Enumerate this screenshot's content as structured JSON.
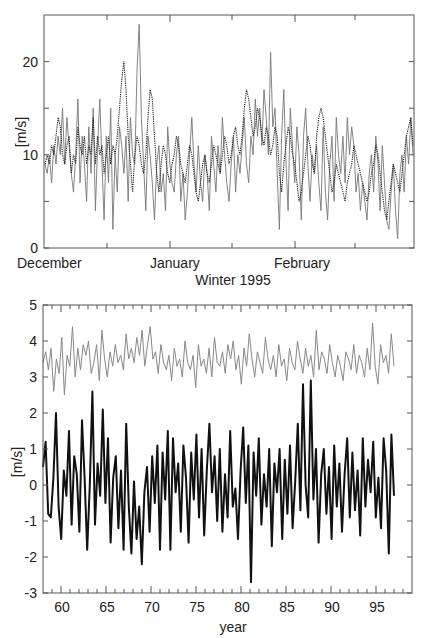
{
  "chart_data": [
    {
      "type": "line",
      "title": "",
      "xlabel": "Winter 1995",
      "ylabel": "[m/s]",
      "ylim": [
        0,
        25
      ],
      "yticks": [
        0,
        10,
        20
      ],
      "yticks_minor": [
        5,
        15
      ],
      "xtick_labels": [
        "December",
        "January",
        "February"
      ],
      "grid": false,
      "legend": null,
      "series": [
        {
          "name": "observed (solid grey)",
          "style": "solid",
          "color": "#777777",
          "values": [
            9,
            8,
            10,
            7,
            11,
            9,
            12,
            10,
            15,
            9,
            14,
            11,
            8,
            6,
            10,
            16,
            7,
            12,
            9,
            5,
            13,
            8,
            15,
            4,
            11,
            16,
            9,
            3,
            12,
            7,
            15,
            2,
            10,
            6,
            13,
            11,
            8,
            12,
            5,
            14,
            10,
            9,
            19,
            24,
            14,
            9,
            4,
            12,
            10,
            7,
            3,
            9,
            11,
            6,
            8,
            4,
            13,
            9,
            7,
            6,
            10,
            12,
            5,
            8,
            3,
            6,
            10,
            14,
            9,
            6,
            11,
            7,
            5,
            10,
            8,
            4,
            12,
            9,
            6,
            11,
            8,
            14,
            10,
            7,
            5,
            9,
            12,
            6,
            10,
            8,
            11,
            14,
            9,
            7,
            12,
            10,
            16,
            12,
            15,
            11,
            17,
            14,
            10,
            21,
            13,
            15,
            8,
            2,
            12,
            17,
            9,
            4,
            15,
            11,
            7,
            13,
            10,
            3,
            12,
            15,
            9,
            5,
            10,
            8,
            11,
            7,
            4,
            13,
            6,
            3,
            9,
            12,
            5,
            14,
            10,
            8,
            12,
            7,
            14,
            10,
            13,
            11,
            6,
            8,
            4,
            7,
            5,
            3,
            8,
            10,
            6,
            12,
            9,
            4,
            11,
            7,
            3,
            2,
            6,
            9,
            4,
            1,
            8,
            10,
            6,
            12,
            9,
            14,
            10
          ],
          "ylim": [
            0,
            25
          ]
        },
        {
          "name": "model (dotted dark)",
          "style": "dotted",
          "color": "#222222",
          "values": [
            9,
            10,
            9,
            11,
            10,
            12,
            14,
            13,
            10,
            9,
            11,
            12,
            8,
            10,
            9,
            13,
            11,
            10,
            12,
            9,
            11,
            10,
            14,
            9,
            12,
            10,
            11,
            8,
            10,
            12,
            9,
            11,
            10,
            12,
            15,
            18,
            20,
            17,
            12,
            9,
            6,
            10,
            12,
            11,
            9,
            8,
            10,
            14,
            17,
            16,
            12,
            8,
            6,
            9,
            11,
            10,
            8,
            7,
            9,
            10,
            12,
            11,
            9,
            8,
            7,
            9,
            11,
            10,
            8,
            6,
            5,
            7,
            9,
            10,
            8,
            7,
            9,
            11,
            10,
            9,
            8,
            10,
            12,
            11,
            9,
            10,
            12,
            13,
            11,
            10,
            12,
            15,
            17,
            16,
            14,
            12,
            13,
            15,
            14,
            12,
            11,
            13,
            12,
            10,
            11,
            13,
            12,
            8,
            6,
            9,
            11,
            13,
            12,
            10,
            9,
            7,
            5,
            6,
            8,
            10,
            12,
            11,
            9,
            8,
            12,
            14,
            15,
            14,
            12,
            10,
            8,
            6,
            7,
            9,
            8,
            7,
            6,
            5,
            7,
            8,
            9,
            11,
            10,
            9,
            8,
            7,
            6,
            5,
            6,
            8,
            9,
            11,
            10,
            8,
            6,
            4,
            3,
            5,
            7,
            9,
            8,
            7,
            6,
            8,
            10,
            12,
            13,
            14,
            11
          ],
          "ylim": [
            0,
            25
          ]
        }
      ]
    },
    {
      "type": "line",
      "title": "",
      "xlabel": "year",
      "ylabel": "[m/s]",
      "xlim": [
        58,
        99
      ],
      "xticks": [
        60,
        65,
        70,
        75,
        80,
        85,
        90,
        95
      ],
      "ylim": [
        -3,
        5
      ],
      "yticks": [
        -3,
        -2,
        -1,
        0,
        1,
        2,
        3,
        4,
        5
      ],
      "grid": false,
      "legend": null,
      "series": [
        {
          "name": "upper series (thin grey)",
          "color": "#888888",
          "x_range": [
            58,
            97
          ],
          "mean": 3.4,
          "range": [
            2.4,
            4.6
          ],
          "values": [
            3.4,
            3.7,
            3.2,
            3.8,
            2.6,
            3.5,
            3.1,
            4.1,
            2.5,
            3.6,
            3.3,
            4.4,
            3.0,
            3.8,
            3.2,
            3.9,
            3.6,
            4.0,
            3.1,
            3.4,
            3.9,
            2.9,
            4.3,
            3.5,
            3.0,
            3.7,
            3.3,
            3.9,
            3.4,
            3.6,
            3.2,
            4.2,
            3.5,
            3.8,
            3.4,
            4.1,
            3.6,
            4.3,
            3.3,
            3.9,
            4.4,
            3.5,
            3.7,
            3.1,
            3.9,
            3.4,
            3.2,
            3.6,
            2.9,
            3.8,
            3.3,
            3.5,
            3.0,
            4.0,
            3.4,
            3.2,
            3.6,
            2.7,
            3.9,
            3.3,
            3.5,
            3.1,
            3.8,
            3.0,
            4.1,
            3.4,
            3.3,
            3.7,
            3.1,
            3.9,
            3.5,
            4.0,
            3.2,
            3.6,
            2.8,
            3.8,
            3.3,
            4.2,
            3.5,
            3.0,
            3.7,
            3.4,
            3.1,
            4.1,
            3.5,
            3.2,
            3.6,
            3.0,
            3.9,
            3.3,
            3.5,
            2.9,
            3.8,
            3.4,
            3.2,
            4.0,
            3.5,
            3.1,
            3.8,
            3.3,
            3.6,
            3.0,
            4.3,
            3.2,
            3.7,
            3.5,
            3.1,
            3.9,
            3.4,
            3.0,
            3.6,
            3.3,
            2.9,
            3.7,
            3.5,
            3.2,
            3.9,
            3.1,
            3.6,
            3.4,
            3.0,
            3.8,
            3.2,
            4.5,
            3.3,
            2.8,
            3.9,
            3.4,
            3.6,
            3.1,
            4.2,
            3.3
          ]
        },
        {
          "name": "lower series (thick black)",
          "color": "#111111",
          "x_range": [
            58,
            97
          ],
          "mean": 0.0,
          "range": [
            -2.7,
            2.9
          ],
          "values": [
            0.5,
            1.2,
            -0.8,
            -0.9,
            0.2,
            2.0,
            -0.6,
            -1.5,
            0.4,
            -0.3,
            1.5,
            -1.1,
            0.8,
            0.3,
            -1.3,
            1.8,
            0.2,
            -1.8,
            0.0,
            2.6,
            -1.1,
            0.6,
            -0.3,
            2.1,
            -0.5,
            1.3,
            -1.6,
            0.2,
            0.8,
            -1.2,
            0.4,
            -1.8,
            1.7,
            -0.6,
            -1.9,
            0.1,
            -1.5,
            -0.6,
            -2.2,
            -0.2,
            0.5,
            -1.3,
            0.8,
            -0.5,
            1.1,
            -1.8,
            0.9,
            -0.4,
            1.5,
            -1.8,
            1.3,
            -0.2,
            0.6,
            -1.3,
            1.1,
            0.2,
            -1.6,
            0.9,
            -0.4,
            1.4,
            -0.9,
            1.0,
            -1.4,
            0.4,
            1.7,
            -0.2,
            0.8,
            -1.0,
            1.0,
            -1.3,
            0.3,
            -0.9,
            1.5,
            -0.6,
            -0.1,
            -1.5,
            0.4,
            1.6,
            -0.5,
            1.1,
            -2.7,
            0.9,
            -0.3,
            1.3,
            -1.1,
            0.3,
            -0.6,
            1.0,
            -1.7,
            0.6,
            -0.2,
            1.0,
            -1.5,
            0.7,
            -0.8,
            1.1,
            -1.2,
            0.1,
            1.7,
            -0.7,
            2.8,
            0.0,
            -0.9,
            2.9,
            -0.4,
            1.0,
            -1.6,
            0.3,
            1.0,
            -0.8,
            0.5,
            -1.5,
            1.1,
            -0.6,
            0.6,
            -1.3,
            0.3,
            1.3,
            -0.9,
            0.9,
            -0.7,
            0.4,
            -1.4,
            1.3,
            -0.6,
            0.7,
            -0.2,
            1.2,
            -0.9,
            0.2,
            -1.2,
            1.3,
            0.4,
            -1.9,
            1.4,
            -0.3
          ]
        }
      ]
    }
  ],
  "top_chart": {
    "ylabel": "[m/s]",
    "yticks": [
      "0",
      "10",
      "20"
    ],
    "xtick_labels": [
      "December",
      "January",
      "February"
    ],
    "xlabel": "Winter  1995"
  },
  "bottom_chart": {
    "ylabel": "[m/s]",
    "yticks": [
      "5",
      "4",
      "3",
      "2",
      "1",
      "0",
      "-1",
      "-2",
      "-3"
    ],
    "xticks": [
      "60",
      "65",
      "70",
      "75",
      "80",
      "85",
      "90",
      "95"
    ],
    "xlabel": "year"
  }
}
